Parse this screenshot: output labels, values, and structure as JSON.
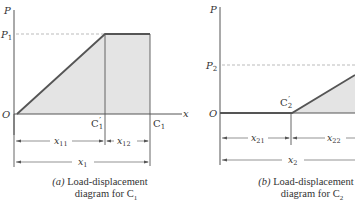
{
  "diagrams": [
    {
      "id": "a",
      "axis_y_label": "P",
      "axis_x_label": "x",
      "origin_label": "O",
      "load_level_label": "P",
      "load_level_sub": "1",
      "point_mid_label": "C",
      "point_mid_sub": "1",
      "point_mid_prime": "′",
      "point_end_label": "C",
      "point_end_sub": "1",
      "dim_first": {
        "label": "x",
        "sub": "11"
      },
      "dim_second": {
        "label": "x",
        "sub": "12"
      },
      "dim_total": {
        "label": "x",
        "sub": "1"
      },
      "caption_tag": "(a)",
      "caption_line1": "Load-displacement",
      "caption_line2": "diagram for C",
      "caption_sub": "1"
    },
    {
      "id": "b",
      "axis_y_label": "P",
      "origin_label": "O",
      "load_level_label": "P",
      "load_level_sub": "2",
      "point_mid_label": "C",
      "point_mid_sub": "2",
      "point_mid_prime": "′",
      "dim_first": {
        "label": "x",
        "sub": "21"
      },
      "dim_second": {
        "label": "x",
        "sub": "22"
      },
      "dim_total": {
        "label": "x",
        "sub": "2"
      },
      "caption_tag": "(b)",
      "caption_line1": "Load-displacement",
      "caption_line2": "diagram for C",
      "caption_sub": "2"
    }
  ],
  "colors": {
    "curve": "#555555",
    "fill": "#e4e4e4",
    "axis": "#555555",
    "dash": "#aaaaaa"
  }
}
